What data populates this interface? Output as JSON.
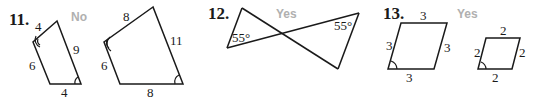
{
  "problems": [
    {
      "number": "11.",
      "answer": "No",
      "figures": [
        {
          "type": "quadrilateral",
          "side_labels": [
            "4",
            "9",
            "4",
            "6"
          ]
        },
        {
          "type": "quadrilateral",
          "side_labels": [
            "8",
            "11",
            "8",
            "6"
          ]
        }
      ]
    },
    {
      "number": "12.",
      "answer": "Yes",
      "figures": [
        {
          "type": "crossed-triangles",
          "angle_labels": [
            "55°",
            "55°"
          ]
        }
      ]
    },
    {
      "number": "13.",
      "answer": "Yes",
      "figures": [
        {
          "type": "rhombus",
          "side_labels": [
            "3",
            "3",
            "3",
            "3"
          ]
        },
        {
          "type": "rhombus",
          "side_labels": [
            "2",
            "2",
            "2",
            "2"
          ]
        }
      ]
    }
  ],
  "colors": {
    "ink": "#1a1a1a",
    "answer_gray": "#b0b0b0",
    "background": "#ffffff"
  }
}
